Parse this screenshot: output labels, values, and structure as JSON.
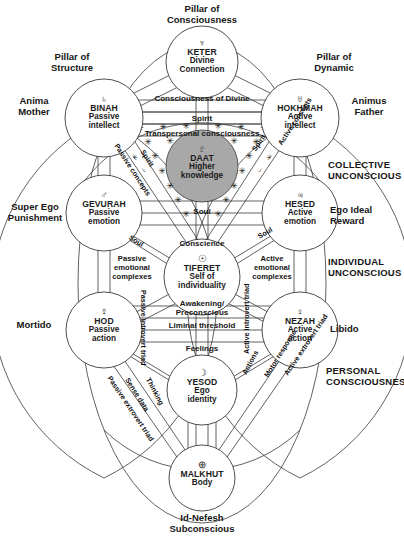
{
  "diagram": {
    "title_top": "Pillar of\nConsciousness",
    "caption_bottom": "Id-Nefesh\nSubconscious"
  },
  "pillars": {
    "top": {
      "line1": "Pillar of",
      "line2": "Consciousness"
    },
    "left": {
      "line1": "Pillar of",
      "line2": "Structure"
    },
    "right": {
      "line1": "Pillar of",
      "line2": "Dynamic"
    }
  },
  "side_labels_left": [
    {
      "name": "anima-mother",
      "line1": "Anima",
      "line2": "Mother"
    },
    {
      "name": "super-ego-punishment",
      "line1": "Super Ego",
      "line2": "Punishment"
    },
    {
      "name": "mortido",
      "line1": "Mortido",
      "line2": ""
    }
  ],
  "side_labels_right": [
    {
      "name": "animus-father",
      "line1": "Animus",
      "line2": "Father"
    },
    {
      "name": "collective-unconscious",
      "line1": "COLLECTIVE",
      "line2": "UNCONSCIOUS"
    },
    {
      "name": "ego-ideal-reward",
      "line1": "Ego Ideal",
      "line2": "Reward"
    },
    {
      "name": "individual-unconscious",
      "line1": "INDIVIDUAL",
      "line2": "UNCONSCIOUS"
    },
    {
      "name": "libido",
      "line1": "Libido",
      "line2": ""
    },
    {
      "name": "personal-consciousness",
      "line1": "PERSONAL",
      "line2": "CONSCIOUSNESS"
    }
  ],
  "sephirot": [
    {
      "id": "keter",
      "glyph": "♆",
      "glyph_name": "neptune-symbol",
      "name": "KETER",
      "desc1": "Divine",
      "desc2": "Connection"
    },
    {
      "id": "binah",
      "glyph": "♄",
      "glyph_name": "saturn-symbol",
      "name": "BINAH",
      "desc1": "Passive",
      "desc2": "intellect"
    },
    {
      "id": "hokhmah",
      "glyph": "♅",
      "glyph_name": "uranus-symbol",
      "name": "HOKHMAH",
      "desc1": "Active",
      "desc2": "intellect"
    },
    {
      "id": "daat",
      "glyph": "♇",
      "glyph_name": "pluto-symbol",
      "name": "DAAT",
      "desc1": "Higher",
      "desc2": "knowledge"
    },
    {
      "id": "gevurah",
      "glyph": "♂",
      "glyph_name": "mars-symbol",
      "name": "GEVURAH",
      "desc1": "Passive",
      "desc2": "emotion"
    },
    {
      "id": "hesed",
      "glyph": "♃",
      "glyph_name": "jupiter-symbol",
      "name": "HESED",
      "desc1": "Active",
      "desc2": "emotion"
    },
    {
      "id": "tiferet",
      "glyph": "☉",
      "glyph_name": "sun-symbol",
      "name": "TIFERET",
      "desc1": "Self of",
      "desc2": "individuality"
    },
    {
      "id": "hod",
      "glyph": "☿",
      "glyph_name": "mercury-symbol",
      "name": "HOD",
      "desc1": "Passive",
      "desc2": "action"
    },
    {
      "id": "nezah",
      "glyph": "♀",
      "glyph_name": "venus-symbol",
      "name": "NEZAH",
      "desc1": "Active",
      "desc2": "action"
    },
    {
      "id": "yesod",
      "glyph": "☽",
      "glyph_name": "moon-symbol",
      "name": "YESOD",
      "desc1": "Ego",
      "desc2": "identity"
    },
    {
      "id": "malkhut",
      "glyph": "⊕",
      "glyph_name": "earth-symbol",
      "name": "MALKHUT",
      "desc1": "Body",
      "desc2": ""
    }
  ],
  "bands": [
    {
      "name": "consciousness-of-divine",
      "text": "Consciousness of Divine"
    },
    {
      "name": "spirit-band",
      "text": "Spirit"
    },
    {
      "name": "transpersonal-band",
      "text": "Transpersonal consciousness"
    },
    {
      "name": "soul-band",
      "text": "Soul"
    },
    {
      "name": "conscience-band",
      "text": "Conscience"
    },
    {
      "name": "awakening-band",
      "text": "Awakening/"
    },
    {
      "name": "preconscious-band",
      "text": "Preconscious"
    },
    {
      "name": "liminal-threshold-band",
      "text": "Liminal threshold"
    },
    {
      "name": "feelings-band",
      "text": "Feelings"
    }
  ],
  "paths": [
    {
      "name": "path-passive-concepts",
      "text": "Passive concepts"
    },
    {
      "name": "path-spirit-left",
      "text": "Spirit"
    },
    {
      "name": "path-spirit-right",
      "text": "Spirit"
    },
    {
      "name": "path-active-concepts",
      "text": "Active concepts"
    },
    {
      "name": "path-soul-left",
      "text": "Soul"
    },
    {
      "name": "path-soul-right",
      "text": "Soul"
    },
    {
      "name": "path-passive-emotional",
      "text": "Passive\nemotional\ncomplexes"
    },
    {
      "name": "path-active-emotional",
      "text": "Active\nemotional\ncomplexes"
    },
    {
      "name": "path-passive-introvert-triad",
      "text": "Passive introvert triad"
    },
    {
      "name": "path-active-introvert-triad",
      "text": "Active introvert triad"
    },
    {
      "name": "path-thinking",
      "text": "Thinking"
    },
    {
      "name": "path-sense-data",
      "text": "Sense data"
    },
    {
      "name": "path-passive-extrovert-triad",
      "text": "Passive extrovert triad"
    },
    {
      "name": "path-actions",
      "text": "Actions"
    },
    {
      "name": "path-motor-response",
      "text": "Motor response"
    },
    {
      "name": "path-active-extrovert-triad",
      "text": "Active extrovert triad"
    }
  ],
  "emotional_complex_left": {
    "l1": "Passive",
    "l2": "emotional",
    "l3": "complexes"
  },
  "emotional_complex_right": {
    "l1": "Active",
    "l2": "emotional",
    "l3": "complexes"
  },
  "colors": {
    "stroke": "#3a3a3a",
    "daat_fill": "#a8a8a8",
    "text": "#161616",
    "background": "#ffffff"
  }
}
